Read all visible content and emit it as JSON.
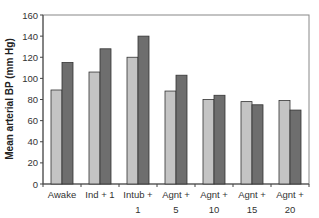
{
  "chart_data": {
    "type": "bar",
    "title": "",
    "xlabel": "",
    "ylabel": "Mean arterial BP (mm Hg)",
    "ylim": [
      0,
      160
    ],
    "yticks": [
      0,
      20,
      40,
      60,
      80,
      100,
      120,
      140,
      160
    ],
    "grid": false,
    "legend": null,
    "categories": [
      [
        "Awake"
      ],
      [
        "Ind + 1"
      ],
      [
        "Intub +",
        "1"
      ],
      [
        "Agnt +",
        "5"
      ],
      [
        "Agnt +",
        "10"
      ],
      [
        "Agnt +",
        "15"
      ],
      [
        "Agnt +",
        "20"
      ]
    ],
    "category_labels": [
      "Awake",
      "Ind + 1",
      "Intub + 1",
      "Agnt + 5",
      "Agnt + 10",
      "Agnt + 15",
      "Agnt + 20"
    ],
    "series": [
      {
        "name": "Series 1",
        "color": "#c4c4c4",
        "values": [
          89,
          106,
          120,
          88,
          80,
          78,
          79
        ]
      },
      {
        "name": "Series 2",
        "color": "#6e6e6e",
        "values": [
          115,
          128,
          140,
          103,
          84,
          75,
          70
        ]
      }
    ]
  },
  "layout": {
    "plot_left": 43,
    "plot_top": 15,
    "plot_right": 309,
    "plot_bottom": 184,
    "bar_width": 11,
    "outline_color": "#333333",
    "frame_color": "#888888"
  }
}
